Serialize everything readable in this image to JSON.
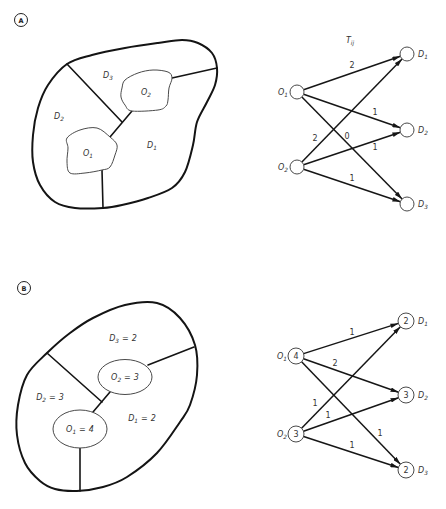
{
  "panel_a": {
    "label": "A",
    "map_labels": {
      "d3": {
        "base": "D",
        "sub": "3"
      },
      "o2": {
        "base": "O",
        "sub": "2"
      },
      "d2": {
        "base": "D",
        "sub": "2"
      },
      "o1": {
        "base": "O",
        "sub": "1"
      },
      "d1": {
        "base": "D",
        "sub": "1"
      }
    },
    "network": {
      "title": {
        "base": "T",
        "sub": "ij"
      },
      "origins": [
        {
          "base": "O",
          "sub": "1"
        },
        {
          "base": "O",
          "sub": "2"
        }
      ],
      "destinations": [
        {
          "base": "D",
          "sub": "1"
        },
        {
          "base": "D",
          "sub": "2"
        },
        {
          "base": "D",
          "sub": "3"
        }
      ],
      "flows": {
        "o1_d1": "2",
        "o1_d2": "1",
        "o1_d3": "0",
        "o2_d1": "2",
        "o2_d2": "1",
        "o2_d3": "1"
      }
    }
  },
  "panel_b": {
    "label": "B",
    "map_labels": {
      "d3": {
        "base": "D",
        "sub": "3",
        "eq": "=",
        "value": "2"
      },
      "o2": {
        "base": "O",
        "sub": "2",
        "eq": "=",
        "value": "3"
      },
      "d2": {
        "base": "D",
        "sub": "2",
        "eq": "=",
        "value": "3"
      },
      "o1": {
        "base": "O",
        "sub": "1",
        "eq": "=",
        "value": "4"
      },
      "d1": {
        "base": "D",
        "sub": "1",
        "eq": "=",
        "value": "2"
      }
    },
    "network": {
      "origins": [
        {
          "base": "O",
          "sub": "1",
          "total": "4"
        },
        {
          "base": "O",
          "sub": "2",
          "total": "3"
        }
      ],
      "destinations": [
        {
          "base": "D",
          "sub": "1",
          "total": "2"
        },
        {
          "base": "D",
          "sub": "2",
          "total": "3"
        },
        {
          "base": "D",
          "sub": "3",
          "total": "2"
        }
      ],
      "flows": {
        "o1_d1": "1",
        "o1_d2": "2",
        "o1_d3": "1",
        "o2_d1": "1",
        "o2_d2": "1",
        "o2_d3": "1"
      }
    }
  }
}
